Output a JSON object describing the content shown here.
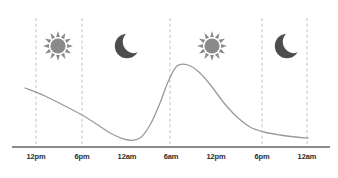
{
  "chart_data": {
    "type": "line",
    "title": "",
    "xlabel": "",
    "ylabel": "",
    "grid": true,
    "legend_position": "none",
    "xlim": [
      0,
      338
    ],
    "ylim": [
      147,
      55
    ],
    "x_ticks": [
      {
        "label": "12pm",
        "x": 36
      },
      {
        "label": "6pm",
        "x": 82
      },
      {
        "label": "12am",
        "x": 127
      },
      {
        "label": "6am",
        "x": 171
      },
      {
        "label": "12pm",
        "x": 216
      },
      {
        "label": "6pm",
        "x": 262
      },
      {
        "label": "12am",
        "x": 307
      }
    ],
    "gridline_x": [
      36,
      82,
      170,
      262,
      307
    ],
    "series": [
      {
        "name": "daily-cycle",
        "color": "#9a9a9a",
        "points": [
          {
            "x": 25,
            "y": 88
          },
          {
            "x": 45,
            "y": 96
          },
          {
            "x": 65,
            "y": 106
          },
          {
            "x": 82,
            "y": 115
          },
          {
            "x": 98,
            "y": 125
          },
          {
            "x": 112,
            "y": 134
          },
          {
            "x": 128,
            "y": 140
          },
          {
            "x": 140,
            "y": 138
          },
          {
            "x": 150,
            "y": 125
          },
          {
            "x": 160,
            "y": 103
          },
          {
            "x": 168,
            "y": 82
          },
          {
            "x": 177,
            "y": 66
          },
          {
            "x": 188,
            "y": 65
          },
          {
            "x": 200,
            "y": 73
          },
          {
            "x": 212,
            "y": 87
          },
          {
            "x": 224,
            "y": 103
          },
          {
            "x": 236,
            "y": 116
          },
          {
            "x": 250,
            "y": 127
          },
          {
            "x": 264,
            "y": 132
          },
          {
            "x": 280,
            "y": 135
          },
          {
            "x": 296,
            "y": 137
          },
          {
            "x": 308,
            "y": 138
          }
        ]
      }
    ],
    "annotations": [
      {
        "icon": "sun-icon",
        "x": 58,
        "y": 46,
        "color": "#8a8a8a"
      },
      {
        "icon": "moon-icon",
        "x": 127,
        "y": 46,
        "color": "#4d4d4d"
      },
      {
        "icon": "sun-icon",
        "x": 212,
        "y": 46,
        "color": "#8a8a8a"
      },
      {
        "icon": "moon-icon",
        "x": 287,
        "y": 46,
        "color": "#4d4d4d"
      }
    ]
  },
  "axis": {
    "color": "#8c8c8c",
    "x_start": 12,
    "x_end": 330,
    "y": 147
  },
  "gridline": {
    "color": "#b4b4b4",
    "y_top": 18,
    "y_bottom": 146
  },
  "icons": {
    "sun_label": "sun-icon",
    "moon_label": "moon-icon"
  }
}
